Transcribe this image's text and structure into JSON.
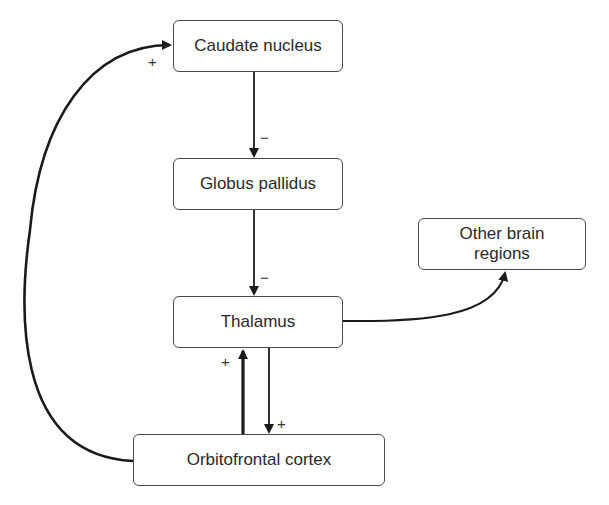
{
  "diagram": {
    "nodes": [
      {
        "id": "caudate",
        "label": "Caudate nucleus"
      },
      {
        "id": "globus",
        "label": "Globus pallidus"
      },
      {
        "id": "thalamus",
        "label": "Thalamus"
      },
      {
        "id": "other",
        "label": "Other brain regions"
      },
      {
        "id": "ofc",
        "label": "Orbitofrontal cortex"
      }
    ],
    "edges": [
      {
        "from": "caudate",
        "to": "globus",
        "sign": "−"
      },
      {
        "from": "globus",
        "to": "thalamus",
        "sign": "−"
      },
      {
        "from": "thalamus",
        "to": "other",
        "sign": ""
      },
      {
        "from": "ofc",
        "to": "thalamus",
        "sign": "+"
      },
      {
        "from": "thalamus",
        "to": "ofc",
        "sign": "+"
      },
      {
        "from": "ofc",
        "to": "caudate",
        "sign": "+"
      }
    ],
    "colors": {
      "line": "#1a1a1a",
      "border": "#4a4a4a",
      "text": "#2a2a2a"
    }
  }
}
